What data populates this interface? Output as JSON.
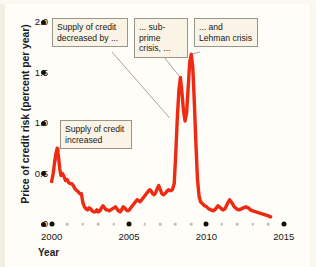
{
  "chart_data": {
    "type": "line",
    "title": "",
    "xlabel": "Year",
    "ylabel": "Price of credit risk (percent per year)",
    "xlim": [
      1999.7,
      2015.4
    ],
    "ylim": [
      0,
      2.0
    ],
    "grid": false,
    "legend": "none",
    "line_color": "#ee2a13",
    "y_ticks": [
      {
        "value": 2.0,
        "label": "2.0"
      },
      {
        "value": 1.5,
        "label": "1.5"
      },
      {
        "value": 1.0,
        "label": "1.0"
      },
      {
        "value": 0.5,
        "label": "0.5"
      },
      {
        "value": 0.0,
        "label": "0"
      }
    ],
    "x_ticks_major": [
      {
        "value": 2000,
        "label": "2000"
      },
      {
        "value": 2005,
        "label": "2005"
      },
      {
        "value": 2010,
        "label": "2010"
      },
      {
        "value": 2015,
        "label": "2015"
      }
    ],
    "x_ticks_minor": [
      2001,
      2002,
      2003,
      2004,
      2006,
      2007,
      2008,
      2009,
      2011,
      2012,
      2013,
      2014
    ],
    "series": [
      {
        "name": "Price of credit risk",
        "x": [
          2000.0,
          2000.1,
          2000.2,
          2000.28,
          2000.36,
          2000.45,
          2000.52,
          2000.6,
          2000.7,
          2000.8,
          2000.9,
          2001.0,
          2001.1,
          2001.2,
          2001.3,
          2001.4,
          2001.5,
          2001.62,
          2001.72,
          2001.82,
          2001.92,
          2002.02,
          2002.12,
          2002.22,
          2002.32,
          2002.42,
          2002.52,
          2002.62,
          2002.72,
          2002.82,
          2002.92,
          2003.02,
          2003.12,
          2003.22,
          2003.32,
          2003.42,
          2003.52,
          2003.62,
          2003.72,
          2003.82,
          2003.92,
          2004.02,
          2004.12,
          2004.22,
          2004.32,
          2004.42,
          2004.52,
          2004.62,
          2004.72,
          2004.82,
          2004.92,
          2005.02,
          2005.12,
          2005.22,
          2005.32,
          2005.42,
          2005.52,
          2005.62,
          2005.72,
          2005.82,
          2005.92,
          2006.02,
          2006.12,
          2006.22,
          2006.32,
          2006.42,
          2006.52,
          2006.62,
          2006.72,
          2006.82,
          2006.92,
          2007.02,
          2007.12,
          2007.22,
          2007.32,
          2007.42,
          2007.55,
          2007.68,
          2007.8,
          2007.92,
          2008.02,
          2008.12,
          2008.22,
          2008.32,
          2008.42,
          2008.52,
          2008.62,
          2008.72,
          2008.82,
          2008.92,
          2009.02,
          2009.12,
          2009.22,
          2009.32,
          2009.42,
          2009.52,
          2009.62,
          2009.75,
          2009.88,
          2010.02,
          2010.15,
          2010.3,
          2010.45,
          2010.6,
          2010.75,
          2010.9,
          2011.05,
          2011.2,
          2011.35,
          2011.5,
          2011.65,
          2011.8,
          2011.95,
          2012.1,
          2012.25,
          2012.4,
          2012.55,
          2012.7,
          2012.85,
          2013.0,
          2013.2,
          2013.4,
          2013.6,
          2013.8,
          2014.0,
          2014.15
        ],
        "y": [
          0.42,
          0.5,
          0.62,
          0.7,
          0.75,
          0.66,
          0.55,
          0.48,
          0.5,
          0.47,
          0.43,
          0.44,
          0.41,
          0.4,
          0.4,
          0.38,
          0.35,
          0.33,
          0.32,
          0.3,
          0.3,
          0.21,
          0.17,
          0.15,
          0.14,
          0.16,
          0.15,
          0.13,
          0.12,
          0.12,
          0.14,
          0.12,
          0.13,
          0.16,
          0.18,
          0.16,
          0.14,
          0.14,
          0.13,
          0.14,
          0.15,
          0.16,
          0.17,
          0.15,
          0.13,
          0.12,
          0.14,
          0.17,
          0.16,
          0.14,
          0.13,
          0.14,
          0.16,
          0.18,
          0.2,
          0.22,
          0.24,
          0.23,
          0.22,
          0.24,
          0.26,
          0.28,
          0.3,
          0.32,
          0.34,
          0.33,
          0.3,
          0.29,
          0.31,
          0.35,
          0.38,
          0.34,
          0.3,
          0.29,
          0.3,
          0.32,
          0.34,
          0.33,
          0.34,
          0.4,
          0.7,
          1.05,
          1.32,
          1.45,
          1.3,
          1.12,
          1.02,
          1.1,
          1.35,
          1.6,
          1.68,
          1.55,
          1.2,
          0.8,
          0.45,
          0.28,
          0.22,
          0.2,
          0.18,
          0.17,
          0.15,
          0.14,
          0.13,
          0.15,
          0.18,
          0.16,
          0.14,
          0.15,
          0.2,
          0.24,
          0.21,
          0.17,
          0.15,
          0.14,
          0.15,
          0.16,
          0.17,
          0.16,
          0.14,
          0.13,
          0.12,
          0.11,
          0.1,
          0.09,
          0.08,
          0.07
        ]
      }
    ],
    "annotations": [
      {
        "id": "callout-supply-decreased",
        "text": "Supply of credit decreased by ...",
        "points_to_x": 2007.62,
        "points_to_y": 1.05
      },
      {
        "id": "callout-subprime",
        "text": "... sub-prime crisis, ...",
        "points_to_x": 2008.32,
        "points_to_y": 1.45
      },
      {
        "id": "callout-lehman",
        "text": "... and Lehman crisis",
        "points_to_x": 2009.02,
        "points_to_y": 1.68
      },
      {
        "id": "callout-supply-increased",
        "text": "Supply of credit increased",
        "points_to_x": 2000.3,
        "points_to_y": 0.62
      }
    ]
  },
  "callouts": {
    "supply_decreased": "Supply of credit decreased by ...",
    "subprime": "... sub-prime crisis, ...",
    "lehman": "... and Lehman crisis",
    "supply_increased": "Supply of credit increased"
  }
}
